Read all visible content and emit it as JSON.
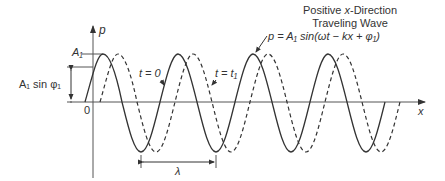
{
  "title": {
    "line1_pre": "Positive ",
    "line1_var": "x",
    "line1_post": "-Direction",
    "line2": "Traveling Wave"
  },
  "equation": "p = A₁ sin(ωt − kx + φ₁)",
  "axes": {
    "y_label": "p",
    "x_label": "x",
    "origin_label": "0"
  },
  "labels": {
    "amplitude": "A₁",
    "offset": "A₁ sin φ₁",
    "curve_t0": "t = 0",
    "curve_t1": "t = t₁",
    "wavelength": "λ"
  },
  "colors": {
    "line": "#333333",
    "background": "#ffffff"
  }
}
